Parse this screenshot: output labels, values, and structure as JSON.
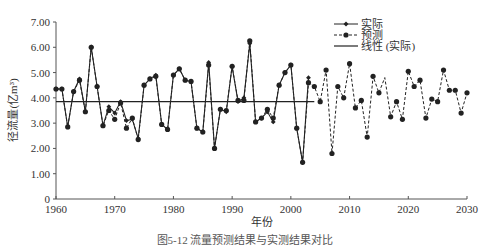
{
  "chart_data": {
    "type": "line",
    "title": "",
    "xlabel": "年份",
    "ylabel": "径流量(亿m³)",
    "xlim": [
      1960,
      2030
    ],
    "ylim": [
      0,
      7
    ],
    "x_ticks": [
      "1960",
      "1970",
      "1980",
      "1990",
      "2000",
      "2010",
      "2020",
      "2030"
    ],
    "y_ticks": [
      "0",
      "1.00",
      "2.00",
      "3.00",
      "4.00",
      "5.00",
      "6.00",
      "7.00"
    ],
    "grid": false,
    "legend_position": "top-right",
    "legend": [
      "实际",
      "预测",
      "线性 (实际)"
    ],
    "series": [
      {
        "name": "实际",
        "style": "solid line with small diamond markers",
        "x": [
          1960,
          1961,
          1962,
          1963,
          1964,
          1965,
          1966,
          1967,
          1968,
          1969,
          1970,
          1971,
          1972,
          1973,
          1974,
          1975,
          1976,
          1977,
          1978,
          1979,
          1980,
          1981,
          1982,
          1983,
          1984,
          1985,
          1986,
          1987,
          1988,
          1989,
          1990,
          1991,
          1992,
          1993,
          1994,
          1995,
          1996,
          1997,
          1998,
          1999,
          2000,
          2001,
          2002,
          2003
        ],
        "values": [
          4.35,
          4.35,
          2.85,
          4.25,
          4.75,
          3.45,
          6.02,
          4.45,
          2.9,
          3.65,
          3.4,
          3.85,
          3.1,
          3.15,
          2.4,
          4.5,
          4.75,
          4.9,
          2.95,
          2.75,
          4.9,
          5.15,
          4.7,
          4.65,
          2.8,
          2.65,
          5.4,
          2.0,
          3.55,
          3.45,
          5.25,
          3.85,
          4.0,
          6.15,
          3.05,
          3.2,
          3.45,
          3.05,
          4.5,
          5.0,
          5.3,
          2.8,
          1.45,
          4.8
        ]
      },
      {
        "name": "预测",
        "style": "dashed line with round markers",
        "x": [
          1960,
          1961,
          1962,
          1963,
          1964,
          1965,
          1966,
          1967,
          1968,
          1969,
          1970,
          1971,
          1972,
          1973,
          1974,
          1975,
          1976,
          1977,
          1978,
          1979,
          1980,
          1981,
          1982,
          1983,
          1984,
          1985,
          1986,
          1987,
          1988,
          1989,
          1990,
          1991,
          1992,
          1993,
          1994,
          1995,
          1996,
          1997,
          1998,
          1999,
          2000,
          2001,
          2002,
          2003,
          2004,
          2005,
          2006,
          2007,
          2008,
          2009,
          2010,
          2011,
          2012,
          2013,
          2014,
          2015,
          2016,
          2017,
          2018,
          2019,
          2020,
          2021,
          2022,
          2023,
          2024,
          2025,
          2026,
          2027,
          2028,
          2029,
          2030
        ],
        "values": [
          4.35,
          4.35,
          2.85,
          4.25,
          4.7,
          3.45,
          6.0,
          4.45,
          2.9,
          3.5,
          3.15,
          3.8,
          2.8,
          3.2,
          2.35,
          4.5,
          4.75,
          4.85,
          2.95,
          2.75,
          4.9,
          5.15,
          4.7,
          4.65,
          2.8,
          2.65,
          5.3,
          2.0,
          3.55,
          3.5,
          5.25,
          3.9,
          3.9,
          6.25,
          3.05,
          3.2,
          3.55,
          3.2,
          4.5,
          5.0,
          5.3,
          2.8,
          1.45,
          4.6,
          4.45,
          3.85,
          5.1,
          1.8,
          4.45,
          4.0,
          5.35,
          3.6,
          3.9,
          2.45,
          4.85,
          4.2,
          4.8,
          3.25,
          3.85,
          3.15,
          5.05,
          4.45,
          4.7,
          3.2,
          3.95,
          3.85,
          5.1,
          4.3,
          4.3,
          3.4,
          4.2
        ]
      },
      {
        "name": "线性 (实际)",
        "style": "solid straight trend line",
        "x": [
          1960,
          2004
        ],
        "values": [
          3.85,
          3.85
        ]
      }
    ],
    "caption": "图5-12 流量预测结果与实测结果对比"
  },
  "colors": {
    "line": "#222222",
    "axis": "#555555",
    "background": "#ffffff"
  },
  "plot": {
    "x0": 56,
    "x1": 467,
    "y_top": 22,
    "y_bottom": 199
  }
}
